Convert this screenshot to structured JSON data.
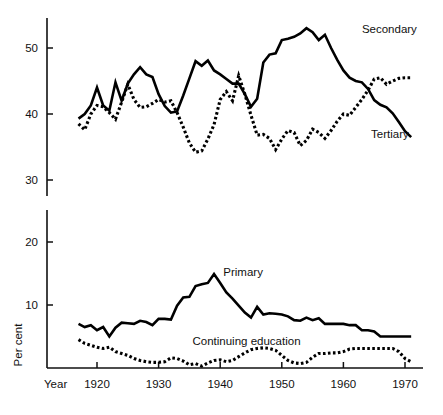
{
  "chart_data": {
    "type": "line",
    "title": "",
    "xlabel": "Year",
    "ylabel": "Per cent",
    "xlim": [
      1917,
      1971
    ],
    "xticks": [
      1920,
      1930,
      1940,
      1950,
      1960,
      1970
    ],
    "xticklabels": [
      "1920",
      "1930",
      "1940",
      "1950",
      "1960",
      "1970"
    ],
    "yticks": [
      10,
      20,
      30,
      40,
      50
    ],
    "yticklabels": [
      "10",
      "20",
      "30",
      "40",
      "50"
    ],
    "y_axis_break": true,
    "y_axis_break_between": [
      20,
      30
    ],
    "grid": false,
    "legend_position": "inline-annotations",
    "annotations": [
      {
        "text": "Secondary",
        "x": 1963,
        "y": 52.2
      },
      {
        "text": "Tertiary",
        "x": 1964.5,
        "y": 36.3
      },
      {
        "text": "Primary",
        "x": 1940.5,
        "y": 14.6
      },
      {
        "text": "Continuing education",
        "x": 1935.5,
        "y": 3.6
      }
    ],
    "series": [
      {
        "name": "Secondary",
        "style": "solid",
        "x": [
          1917,
          1918,
          1919,
          1920,
          1921,
          1922,
          1923,
          1924,
          1925,
          1926,
          1927,
          1928,
          1929,
          1930,
          1931,
          1932,
          1933,
          1934,
          1935,
          1936,
          1937,
          1938,
          1939,
          1940,
          1941,
          1942,
          1943,
          1944,
          1945,
          1946,
          1947,
          1948,
          1949,
          1950,
          1951,
          1952,
          1953,
          1954,
          1955,
          1956,
          1957,
          1958,
          1959,
          1960,
          1961,
          1962,
          1963,
          1964,
          1965,
          1966,
          1967,
          1968,
          1969,
          1970,
          1971
        ],
        "values": [
          39.3,
          40.0,
          41.3,
          44.0,
          41.3,
          40.5,
          44.8,
          42.0,
          44.6,
          46.0,
          47.1,
          46.0,
          45.6,
          43.0,
          41.2,
          40.2,
          40.4,
          42.8,
          45.4,
          48.0,
          47.3,
          48.1,
          46.6,
          46.0,
          45.3,
          44.6,
          44.6,
          43.0,
          41.1,
          42.3,
          47.8,
          49.0,
          49.2,
          51.2,
          51.4,
          51.7,
          52.2,
          53.0,
          52.4,
          51.2,
          52.0,
          50.0,
          48.2,
          46.6,
          45.5,
          45.0,
          44.8,
          43.8,
          42.1,
          41.4,
          41.0,
          40.1,
          38.8,
          37.4,
          36.5
        ]
      },
      {
        "name": "Tertiary",
        "style": "dotted",
        "x": [
          1917,
          1918,
          1919,
          1920,
          1921,
          1922,
          1923,
          1924,
          1925,
          1926,
          1927,
          1928,
          1929,
          1930,
          1931,
          1932,
          1933,
          1934,
          1935,
          1936,
          1937,
          1938,
          1939,
          1940,
          1941,
          1942,
          1943,
          1944,
          1945,
          1946,
          1947,
          1948,
          1949,
          1950,
          1951,
          1952,
          1953,
          1954,
          1955,
          1956,
          1957,
          1958,
          1959,
          1960,
          1961,
          1962,
          1963,
          1964,
          1965,
          1966,
          1967,
          1968,
          1969,
          1970,
          1971
        ],
        "values": [
          38.5,
          37.6,
          40.0,
          41.3,
          41.1,
          40.2,
          39.2,
          41.8,
          44.5,
          42.2,
          41.0,
          41.1,
          41.6,
          42.2,
          41.8,
          42.0,
          40.2,
          38.0,
          35.6,
          34.2,
          34.4,
          36.2,
          38.4,
          42.2,
          43.4,
          42.0,
          45.8,
          43.0,
          39.8,
          36.8,
          36.9,
          36.3,
          34.6,
          36.2,
          37.5,
          37.2,
          35.2,
          36.0,
          37.7,
          37.2,
          36.3,
          37.5,
          38.9,
          40.0,
          39.8,
          41.0,
          42.2,
          43.6,
          45.3,
          45.5,
          44.5,
          45.0,
          45.4,
          45.5,
          45.5
        ]
      },
      {
        "name": "Primary",
        "style": "solid",
        "x": [
          1917,
          1918,
          1919,
          1920,
          1921,
          1922,
          1923,
          1924,
          1925,
          1926,
          1927,
          1928,
          1929,
          1930,
          1931,
          1932,
          1933,
          1934,
          1935,
          1936,
          1937,
          1938,
          1939,
          1940,
          1941,
          1942,
          1943,
          1944,
          1945,
          1946,
          1947,
          1948,
          1949,
          1950,
          1951,
          1952,
          1953,
          1954,
          1955,
          1956,
          1957,
          1958,
          1959,
          1960,
          1961,
          1962,
          1963,
          1964,
          1965,
          1966,
          1967,
          1968,
          1969,
          1970,
          1971
        ],
        "values": [
          7.0,
          6.5,
          6.8,
          6.0,
          6.5,
          5.0,
          6.4,
          7.2,
          7.1,
          7.0,
          7.5,
          7.3,
          6.8,
          7.8,
          7.8,
          7.7,
          9.9,
          11.2,
          11.3,
          13.0,
          13.3,
          13.5,
          14.9,
          13.5,
          12.0,
          11.0,
          9.9,
          8.8,
          8.0,
          9.7,
          8.5,
          8.7,
          8.6,
          8.5,
          8.2,
          7.6,
          7.5,
          8.0,
          7.6,
          7.9,
          7.0,
          7.0,
          7.0,
          7.0,
          6.8,
          6.8,
          6.0,
          6.0,
          5.8,
          5.0,
          5.0,
          5.0,
          5.0,
          5.0,
          5.0
        ]
      },
      {
        "name": "Continuing education",
        "style": "dotted",
        "x": [
          1917,
          1918,
          1919,
          1920,
          1921,
          1922,
          1923,
          1924,
          1925,
          1926,
          1927,
          1928,
          1929,
          1930,
          1931,
          1932,
          1933,
          1934,
          1935,
          1936,
          1937,
          1938,
          1939,
          1940,
          1941,
          1942,
          1943,
          1944,
          1945,
          1946,
          1947,
          1948,
          1949,
          1950,
          1951,
          1952,
          1953,
          1954,
          1955,
          1956,
          1957,
          1958,
          1959,
          1960,
          1961,
          1962,
          1963,
          1964,
          1965,
          1966,
          1967,
          1968,
          1969,
          1970,
          1971
        ],
        "values": [
          4.5,
          3.9,
          3.6,
          3.3,
          3.1,
          3.3,
          2.6,
          2.3,
          2.0,
          1.5,
          1.2,
          1.0,
          0.9,
          0.9,
          1.0,
          1.6,
          1.5,
          1.1,
          0.5,
          0.7,
          0.3,
          0.8,
          1.2,
          1.3,
          1.0,
          1.2,
          1.8,
          2.4,
          2.9,
          3.1,
          3.2,
          3.1,
          2.8,
          2.0,
          1.2,
          0.8,
          0.7,
          0.9,
          1.7,
          2.3,
          2.3,
          2.4,
          2.4,
          2.6,
          3.0,
          3.1,
          3.1,
          3.1,
          3.1,
          3.1,
          3.1,
          3.1,
          2.6,
          1.5,
          1.0
        ]
      }
    ]
  }
}
